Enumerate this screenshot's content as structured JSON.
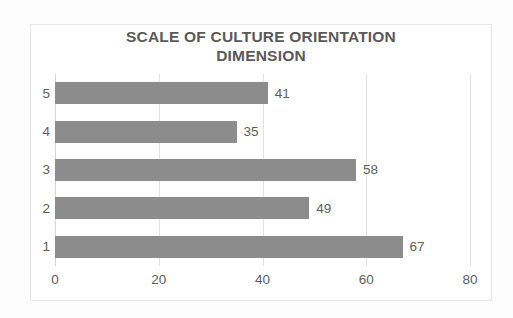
{
  "chart_data": {
    "type": "bar",
    "orientation": "horizontal",
    "title": "SCALE OF CULTURE ORIENTATION DIMENSION",
    "title_lines": [
      "SCALE OF CULTURE ORIENTATION",
      "DIMENSION"
    ],
    "categories": [
      "5",
      "4",
      "3",
      "2",
      "1"
    ],
    "values": [
      41,
      35,
      58,
      49,
      67
    ],
    "data_labels": [
      "41",
      "35",
      "58",
      "49",
      "67"
    ],
    "xlabel": "",
    "ylabel": "",
    "xlim": [
      0,
      80
    ],
    "xticks": [
      0,
      20,
      40,
      60,
      80
    ],
    "xtick_labels": [
      "0",
      "20",
      "40",
      "60",
      "80"
    ],
    "grid": true,
    "grid_axis": "x",
    "legend": false,
    "bar_color": "#8c8c8c",
    "title_color": "#595959",
    "label_color": "#5e5e5e",
    "gridline_color": "#e2e2e2",
    "background": "#ffffff"
  }
}
